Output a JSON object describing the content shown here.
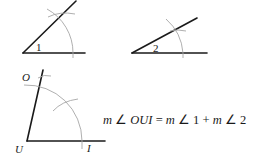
{
  "figures": [
    {
      "id": "angle-1",
      "label": "1",
      "vertex": [
        23,
        53
      ]
    },
    {
      "id": "angle-2",
      "label": "2",
      "vertex": [
        132,
        53
      ]
    },
    {
      "id": "angle-OUI",
      "points": {
        "O": "O",
        "U": "U",
        "I": "I"
      },
      "vertex": [
        27,
        141
      ]
    }
  ],
  "equation": {
    "m1": "m",
    "angle_sym1": "∠",
    "lhs_name": "OUI",
    "equals": "=",
    "m2": "m",
    "angle_sym2": "∠",
    "rhs1": "1",
    "plus": "+",
    "m3": "m",
    "angle_sym3": "∠",
    "rhs2": "2"
  },
  "colors": {
    "line": "#1a1a1a",
    "arc": "#a6a6a6"
  }
}
